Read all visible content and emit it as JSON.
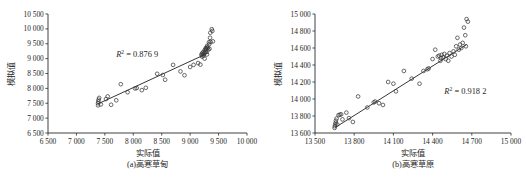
{
  "figure": {
    "panels": [
      {
        "id": "a",
        "caption": "(a)高寒草甸",
        "xlabel": "实际值",
        "ylabel": "模拟值",
        "r2_text": "= 0.876 9",
        "r2_symbol": "R",
        "r2_exponent": "2",
        "chart_data": {
          "type": "scatter",
          "title": "(a)高寒草甸",
          "xlabel": "实际值",
          "ylabel": "模拟值",
          "xlim": [
            6500,
            10000
          ],
          "ylim": [
            6500,
            10500
          ],
          "xticks": [
            6500,
            7000,
            7500,
            8000,
            8500,
            9000,
            9500,
            10000
          ],
          "xtick_labels": [
            "6 500",
            "7 000",
            "7 500",
            "8 000",
            "8 500",
            "9 000",
            "9 500",
            "10 000"
          ],
          "yticks": [
            6500,
            7000,
            7500,
            8000,
            8500,
            9000,
            9500,
            10000,
            10500
          ],
          "ytick_labels": [
            "6 500",
            "7 000",
            "7 500",
            "8 000",
            "8 500",
            "9 000",
            "9 500",
            "10 000",
            "10 500"
          ],
          "grid": false,
          "legend": "none",
          "r2": 0.8769,
          "annotations": [
            {
              "text": "R2 = 0.876 9",
              "x": 7700,
              "y": 9060
            }
          ],
          "trendline": {
            "x": [
              7380,
              9330
            ],
            "y": [
              7480,
              9200
            ]
          },
          "points": [
            {
              "x": 7380,
              "y": 7430
            },
            {
              "x": 7380,
              "y": 7500
            },
            {
              "x": 7385,
              "y": 7560
            },
            {
              "x": 7390,
              "y": 7620
            },
            {
              "x": 7400,
              "y": 7680
            },
            {
              "x": 7430,
              "y": 7460
            },
            {
              "x": 7520,
              "y": 7640
            },
            {
              "x": 7550,
              "y": 7730
            },
            {
              "x": 7610,
              "y": 7450
            },
            {
              "x": 7700,
              "y": 7600
            },
            {
              "x": 7780,
              "y": 8140
            },
            {
              "x": 7900,
              "y": 7870
            },
            {
              "x": 8030,
              "y": 8000
            },
            {
              "x": 8060,
              "y": 8010
            },
            {
              "x": 8150,
              "y": 7940
            },
            {
              "x": 8220,
              "y": 8020
            },
            {
              "x": 8420,
              "y": 8490
            },
            {
              "x": 8520,
              "y": 8450
            },
            {
              "x": 8560,
              "y": 8290
            },
            {
              "x": 8700,
              "y": 8790
            },
            {
              "x": 8830,
              "y": 8570
            },
            {
              "x": 8900,
              "y": 8440
            },
            {
              "x": 9000,
              "y": 8720
            },
            {
              "x": 9060,
              "y": 8790
            },
            {
              "x": 9140,
              "y": 8850
            },
            {
              "x": 9180,
              "y": 8800
            },
            {
              "x": 9200,
              "y": 9120
            },
            {
              "x": 9205,
              "y": 9160
            },
            {
              "x": 9210,
              "y": 9070
            },
            {
              "x": 9220,
              "y": 9200
            },
            {
              "x": 9230,
              "y": 9150
            },
            {
              "x": 9235,
              "y": 9100
            },
            {
              "x": 9240,
              "y": 9240
            },
            {
              "x": 9250,
              "y": 9180
            },
            {
              "x": 9255,
              "y": 9000
            },
            {
              "x": 9260,
              "y": 9300
            },
            {
              "x": 9270,
              "y": 9230
            },
            {
              "x": 9275,
              "y": 9350
            },
            {
              "x": 9280,
              "y": 9290
            },
            {
              "x": 9285,
              "y": 9330
            },
            {
              "x": 9290,
              "y": 9380
            },
            {
              "x": 9295,
              "y": 9140
            },
            {
              "x": 9300,
              "y": 9430
            },
            {
              "x": 9310,
              "y": 9360
            },
            {
              "x": 9320,
              "y": 9300
            },
            {
              "x": 9330,
              "y": 9550
            },
            {
              "x": 9335,
              "y": 9480
            },
            {
              "x": 9340,
              "y": 9330
            },
            {
              "x": 9350,
              "y": 9700
            },
            {
              "x": 9355,
              "y": 9870
            },
            {
              "x": 9360,
              "y": 9560
            },
            {
              "x": 9380,
              "y": 9990
            },
            {
              "x": 9390,
              "y": 9930
            },
            {
              "x": 9400,
              "y": 9580
            }
          ]
        }
      },
      {
        "id": "b",
        "caption": "(b)高寒草原",
        "xlabel": "实际值",
        "ylabel": "模拟值",
        "r2_text": "= 0.918 2",
        "r2_symbol": "R",
        "r2_exponent": "2",
        "chart_data": {
          "type": "scatter",
          "title": "(b)高寒草原",
          "xlabel": "实际值",
          "ylabel": "模拟值",
          "xlim": [
            13500,
            15000
          ],
          "ylim": [
            13600,
            15000
          ],
          "xticks": [
            13500,
            13800,
            14100,
            14400,
            14700,
            15000
          ],
          "xtick_labels": [
            "13 500",
            "13 800",
            "14 100",
            "14 400",
            "14 700",
            "15 000"
          ],
          "yticks": [
            13600,
            13800,
            14000,
            14200,
            14400,
            14600,
            14800,
            15000
          ],
          "ytick_labels": [
            "13 600",
            "13 800",
            "14 000",
            "14 200",
            "14 400",
            "14 600",
            "14 800",
            "15 000"
          ],
          "grid": false,
          "legend": "none",
          "r2": 0.9182,
          "annotations": [
            {
              "text": "R2 = 0.918 2",
              "x": 14490,
              "y": 14060
            }
          ],
          "trendline": {
            "x": [
              13655,
              14660
            ],
            "y": [
              13665,
              14640
            ]
          },
          "points": [
            {
              "x": 13650,
              "y": 13660
            },
            {
              "x": 13652,
              "y": 13680
            },
            {
              "x": 13655,
              "y": 13700
            },
            {
              "x": 13658,
              "y": 13720
            },
            {
              "x": 13660,
              "y": 13745
            },
            {
              "x": 13665,
              "y": 13770
            },
            {
              "x": 13670,
              "y": 13700
            },
            {
              "x": 13680,
              "y": 13810
            },
            {
              "x": 13690,
              "y": 13815
            },
            {
              "x": 13700,
              "y": 13820
            },
            {
              "x": 13710,
              "y": 13760
            },
            {
              "x": 13740,
              "y": 13840
            },
            {
              "x": 13760,
              "y": 13775
            },
            {
              "x": 13790,
              "y": 13730
            },
            {
              "x": 13830,
              "y": 14030
            },
            {
              "x": 13900,
              "y": 13900
            },
            {
              "x": 13950,
              "y": 13960
            },
            {
              "x": 13960,
              "y": 13970
            },
            {
              "x": 13990,
              "y": 13950
            },
            {
              "x": 14020,
              "y": 13930
            },
            {
              "x": 14060,
              "y": 14200
            },
            {
              "x": 14100,
              "y": 14180
            },
            {
              "x": 14120,
              "y": 14090
            },
            {
              "x": 14180,
              "y": 14330
            },
            {
              "x": 14240,
              "y": 14240
            },
            {
              "x": 14300,
              "y": 14180
            },
            {
              "x": 14330,
              "y": 14330
            },
            {
              "x": 14360,
              "y": 14350
            },
            {
              "x": 14370,
              "y": 14360
            },
            {
              "x": 14400,
              "y": 14470
            },
            {
              "x": 14420,
              "y": 14580
            },
            {
              "x": 14440,
              "y": 14500
            },
            {
              "x": 14450,
              "y": 14510
            },
            {
              "x": 14460,
              "y": 14450
            },
            {
              "x": 14465,
              "y": 14480
            },
            {
              "x": 14470,
              "y": 14520
            },
            {
              "x": 14480,
              "y": 14490
            },
            {
              "x": 14490,
              "y": 14530
            },
            {
              "x": 14500,
              "y": 14470
            },
            {
              "x": 14510,
              "y": 14510
            },
            {
              "x": 14520,
              "y": 14450
            },
            {
              "x": 14530,
              "y": 14540
            },
            {
              "x": 14545,
              "y": 14500
            },
            {
              "x": 14560,
              "y": 14560
            },
            {
              "x": 14570,
              "y": 14520
            },
            {
              "x": 14580,
              "y": 14620
            },
            {
              "x": 14590,
              "y": 14720
            },
            {
              "x": 14600,
              "y": 14580
            },
            {
              "x": 14610,
              "y": 14640
            },
            {
              "x": 14620,
              "y": 14600
            },
            {
              "x": 14630,
              "y": 14660
            },
            {
              "x": 14640,
              "y": 14840
            },
            {
              "x": 14650,
              "y": 14750
            },
            {
              "x": 14655,
              "y": 14620
            },
            {
              "x": 14660,
              "y": 14940
            },
            {
              "x": 14670,
              "y": 14910
            }
          ]
        }
      }
    ]
  }
}
